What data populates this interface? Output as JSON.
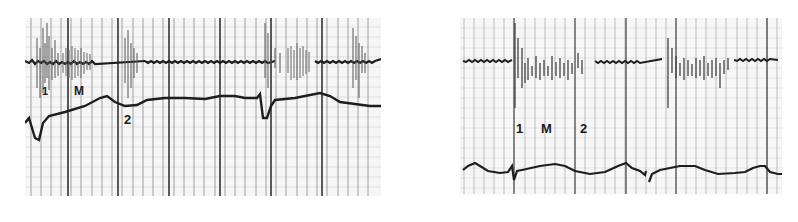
{
  "figure": {
    "panels": [
      {
        "id": "left",
        "traces": [
          "phonocardiogram",
          "pulse-tracing"
        ],
        "labels": [
          {
            "text": "1",
            "x": 42,
            "y": 92
          },
          {
            "text": "M",
            "x": 74,
            "y": 88
          },
          {
            "text": "2",
            "x": 124,
            "y": 116
          }
        ]
      },
      {
        "id": "right",
        "traces": [
          "phonocardiogram",
          "pulse-tracing"
        ],
        "labels": [
          {
            "text": "1",
            "x": 516,
            "y": 122
          },
          {
            "text": "M",
            "x": 541,
            "y": 122
          },
          {
            "text": "2",
            "x": 580,
            "y": 122
          }
        ]
      }
    ],
    "colors": {
      "ink": "#1e1e1e",
      "grid_major": "#555555",
      "grid_minor": "#bdbdbd",
      "paper": "#f7f7f7"
    }
  }
}
